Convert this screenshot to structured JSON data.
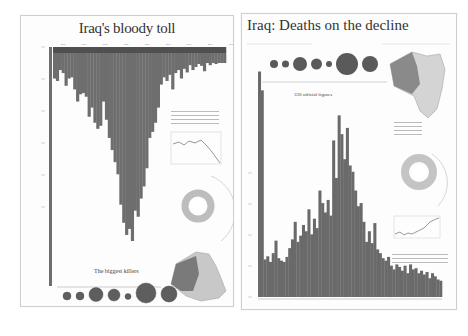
{
  "posters": [
    {
      "id": "left",
      "title": "Iraq's bloody toll",
      "section_title": "The biggest killers",
      "colors": {
        "bars": "#6e6e6e",
        "top_band": "#505050",
        "map_dark": "#7a7a7a",
        "map_light": "#c8c8c8",
        "donut": "#bdbdbd"
      }
    },
    {
      "id": "right",
      "title": "Iraq: Deaths on the decline",
      "annotation": "330 official figures",
      "colors": {
        "bars": "#6a6a6a",
        "map_dark": "#8a8a8a",
        "map_light": "#d4d4d4",
        "donut": "#c4c4c4"
      }
    }
  ],
  "chart_data": [
    {
      "type": "bar",
      "title": "Iraq's bloody toll",
      "orientation": "inverted (bars hang down from top axis)",
      "xlabel": "Month (2003–2011)",
      "ylabel": "Deaths per month",
      "x_ticks": [
        "2003",
        "2004",
        "2005",
        "2006",
        "2007",
        "2008",
        "2009",
        "2010",
        "2011"
      ],
      "values": [
        520,
        560,
        380,
        430,
        640,
        520,
        500,
        700,
        900,
        780,
        760,
        820,
        1150,
        1000,
        1250,
        1350,
        1300,
        900,
        1200,
        1500,
        1700,
        1900,
        2100,
        2600,
        2900,
        3100,
        3000,
        3200,
        2700,
        2800,
        2500,
        2300,
        2000,
        1500,
        1400,
        1250,
        1000,
        620,
        500,
        560,
        460,
        700,
        430,
        380,
        520,
        360,
        420,
        300,
        380,
        330,
        280,
        310,
        400,
        260,
        300,
        240,
        280,
        260,
        230,
        250
      ],
      "ylim": [
        0,
        3200
      ],
      "grid": false
    },
    {
      "type": "bar",
      "title": "Iraq: Deaths on the decline",
      "xlabel": "Month (2003–2011)",
      "ylabel": "Deaths per month",
      "values": [
        3600,
        3300,
        600,
        650,
        560,
        700,
        900,
        620,
        580,
        560,
        640,
        780,
        920,
        1200,
        880,
        980,
        1150,
        1050,
        1400,
        1000,
        1250,
        1100,
        1700,
        1500,
        1350,
        1550,
        1300,
        2500,
        1900,
        2900,
        2600,
        2200,
        2700,
        2100,
        2000,
        1700,
        1450,
        1500,
        1200,
        880,
        1050,
        860,
        1180,
        760,
        700,
        620,
        580,
        640,
        500,
        440,
        520,
        480,
        420,
        500,
        380,
        520,
        440,
        460,
        380,
        420,
        360,
        400,
        300,
        380,
        330,
        280,
        260
      ],
      "ylim": [
        0,
        3800
      ],
      "annotations": [
        "330 official figures"
      ],
      "grid": false
    }
  ],
  "bubbles_left": [
    {
      "r": 4
    },
    {
      "r": 4
    },
    {
      "r": 7
    },
    {
      "r": 6
    },
    {
      "r": 3
    },
    {
      "r": 10
    },
    {
      "r": 8
    }
  ],
  "bubbles_right": [
    {
      "r": 4
    },
    {
      "r": 3.5
    },
    {
      "r": 7
    },
    {
      "r": 5.5
    },
    {
      "r": 3
    },
    {
      "r": 11
    },
    {
      "r": 8
    }
  ]
}
